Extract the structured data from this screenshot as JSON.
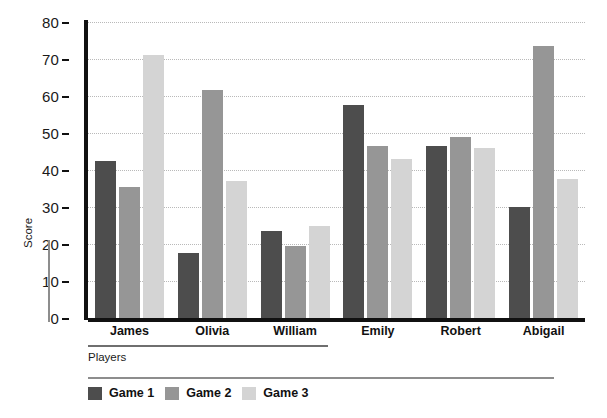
{
  "chart_data": {
    "type": "bar",
    "title": "",
    "xlabel": "Players",
    "ylabel": "Score",
    "categories": [
      "James",
      "Olivia",
      "William",
      "Emily",
      "Robert",
      "Abigail"
    ],
    "series": [
      {
        "name": "Game 1",
        "color": "#4d4d4d",
        "values": [
          42.5,
          17.5,
          23.5,
          57.5,
          46.5,
          30.0
        ]
      },
      {
        "name": "Game 2",
        "color": "#969696",
        "values": [
          35.5,
          61.5,
          19.5,
          46.5,
          49.0,
          73.5
        ]
      },
      {
        "name": "Game 3",
        "color": "#d4d4d4",
        "values": [
          71.0,
          37.0,
          25.0,
          43.0,
          46.0,
          37.5
        ]
      }
    ],
    "ylim": [
      0,
      80
    ],
    "yticks": [
      0,
      10,
      20,
      30,
      40,
      50,
      60,
      70,
      80
    ],
    "ytick_labels": [
      "0",
      "10",
      "20",
      "30",
      "40",
      "50",
      "60",
      "70",
      "80"
    ],
    "grid": true,
    "grid_style": "dotted",
    "grid_axis": "y",
    "legend_position": "bottom-left",
    "axis_color": "#111111",
    "background": "#ffffff"
  }
}
